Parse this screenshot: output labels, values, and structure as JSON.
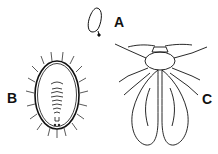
{
  "figure": {
    "panels": [
      {
        "id": "A",
        "label": "A",
        "subject": "egg"
      },
      {
        "id": "B",
        "label": "B",
        "subject": "nymph"
      },
      {
        "id": "C",
        "label": "C",
        "subject": "adult"
      }
    ]
  },
  "colors": {
    "ink": "#111111",
    "background": "#ffffff"
  }
}
